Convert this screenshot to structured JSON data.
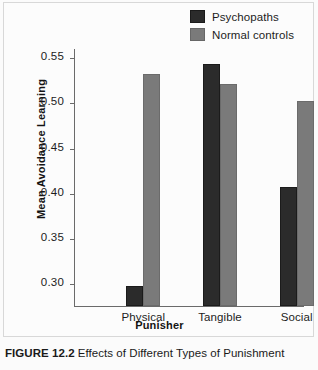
{
  "figure": {
    "caption_label": "FIGURE 12.2",
    "caption_text": "Effects of Different Types of Punishment"
  },
  "colors": {
    "psychopaths": "#2b2b2b",
    "normal_controls": "#7a7a7a",
    "axis": "#6a6a6a",
    "background": "#fcfcfc"
  },
  "chart_data": {
    "type": "bar",
    "title": "",
    "xlabel": "Punisher",
    "ylabel": "Mean Avoidance Learning",
    "categories": [
      "Physical",
      "Tangible",
      "Social"
    ],
    "series": [
      {
        "name": "Psychopaths",
        "color": "#2b2b2b",
        "values": [
          0.297,
          0.542,
          0.407
        ]
      },
      {
        "name": "Normal controls",
        "color": "#7a7a7a",
        "values": [
          0.531,
          0.52,
          0.501
        ]
      }
    ],
    "ylim": [
      0.275,
      0.56
    ],
    "yticks": [
      0.3,
      0.35,
      0.4,
      0.45,
      0.5,
      0.55
    ],
    "ytick_labels": [
      "0.30",
      "0.35",
      "0.40",
      "0.45",
      "0.50",
      "0.55"
    ],
    "grid": false,
    "legend_position": "top-right"
  }
}
